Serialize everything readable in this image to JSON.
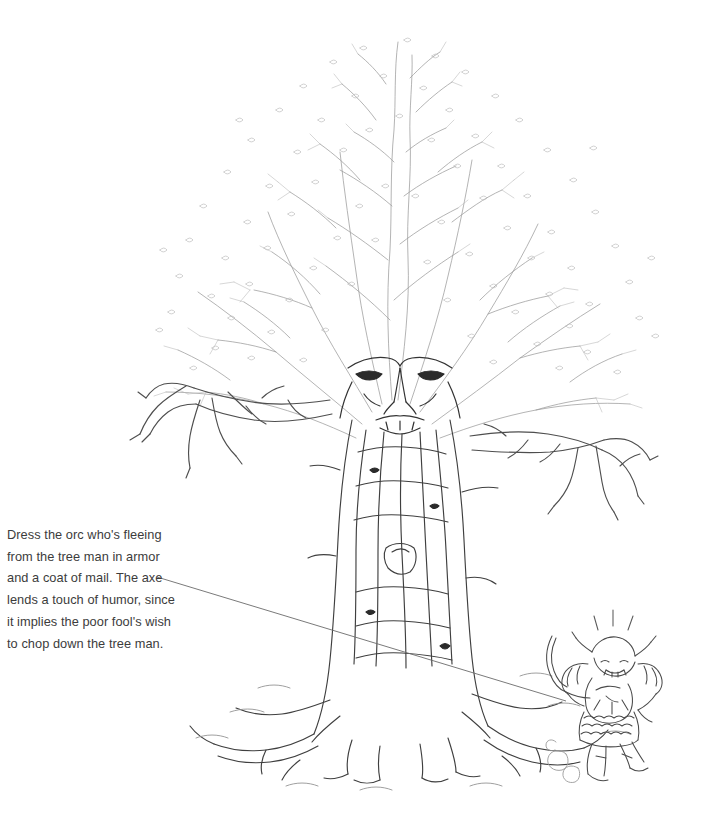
{
  "page": {
    "background_color": "#ffffff",
    "width": 709,
    "height": 819,
    "media": "line-art-illustration"
  },
  "caption": {
    "text": "Dress the orc who's fleeing from the tree man in armor and a coat of mail. The axe lends a touch of humor, since it implies the poor fool's wish to chop down the tree man.",
    "lines": [
      "Dress the orc who's fleeing",
      "from the tree man in armor",
      "and a coat of mail. The axe",
      "lends a touch of humor, since",
      "it implies the poor fool's wish",
      "to chop down the tree man."
    ],
    "color": "#3c3c3c"
  },
  "leader_line": {
    "from_x": 157,
    "from_y": 577,
    "to_x": 566,
    "to_y": 701,
    "color": "#6b6b6b"
  },
  "illustration": {
    "title": "tree-man-and-fleeing-orc",
    "subjects": [
      {
        "name": "tree-man",
        "description": "Giant ent / tree man with a scowling face on the trunk, gnarled braided bark, two long clawed branch-arms and sprawling roots.",
        "bounds": {
          "x": 140,
          "y": 28,
          "width": 505,
          "height": 760
        },
        "parts": [
          {
            "name": "canopy",
            "x": 150,
            "y": 28,
            "width": 545,
            "height": 330
          },
          {
            "name": "face",
            "x": 345,
            "y": 360,
            "width": 110,
            "height": 70
          },
          {
            "name": "left-arm",
            "x": 143,
            "y": 380,
            "width": 190,
            "height": 90
          },
          {
            "name": "right-arm",
            "x": 470,
            "y": 405,
            "width": 175,
            "height": 105
          },
          {
            "name": "trunk",
            "x": 330,
            "y": 400,
            "width": 165,
            "height": 300
          },
          {
            "name": "roots",
            "x": 250,
            "y": 630,
            "width": 290,
            "height": 155
          }
        ]
      },
      {
        "name": "fleeing-orc",
        "description": "Small armored orc running away, carrying an axe over its shoulder, dust puffs at its heels.",
        "bounds": {
          "x": 543,
          "y": 624,
          "width": 125,
          "height": 165
        },
        "parts": [
          {
            "name": "axe",
            "x": 547,
            "y": 632,
            "width": 30,
            "height": 58
          },
          {
            "name": "helmet-head",
            "x": 586,
            "y": 636,
            "width": 42,
            "height": 40
          },
          {
            "name": "torso-armor",
            "x": 566,
            "y": 662,
            "width": 72,
            "height": 60
          },
          {
            "name": "mail-skirt",
            "x": 572,
            "y": 712,
            "width": 62,
            "height": 34
          },
          {
            "name": "legs",
            "x": 575,
            "y": 730,
            "width": 55,
            "height": 52
          },
          {
            "name": "dust-puffs",
            "x": 546,
            "y": 742,
            "width": 42,
            "height": 36
          }
        ]
      }
    ],
    "ink": {
      "dark": "#2a2a2a",
      "mid": "#5a5a5a",
      "light": "#9a9a9a",
      "faint": "#c3c3c3"
    }
  }
}
